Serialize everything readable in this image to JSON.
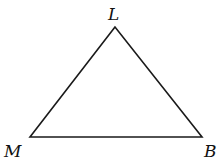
{
  "diagram": {
    "type": "triangle",
    "vertices": [
      {
        "name": "L",
        "x": 115,
        "y": 27
      },
      {
        "name": "M",
        "x": 30,
        "y": 137
      },
      {
        "name": "B",
        "x": 202,
        "y": 137
      }
    ],
    "labels": {
      "top": "L",
      "left": "M",
      "right": "B"
    },
    "stroke_color": "#1a1a1a"
  }
}
